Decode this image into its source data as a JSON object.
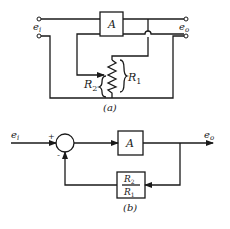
{
  "diagram_a": {
    "caption": "(a)",
    "input_label": "e",
    "input_sub": "i",
    "output_label": "e",
    "output_sub": "o",
    "amplifier_label": "A",
    "r1_label": "R",
    "r1_sub": "1",
    "r2_label": "R",
    "r2_sub": "2"
  },
  "diagram_b": {
    "caption": "(b)",
    "input_label": "e",
    "input_sub": "i",
    "output_label": "e",
    "output_sub": "o",
    "plus_sign": "+",
    "minus_sign": "-",
    "forward_block_label": "A",
    "feedback_num": "R",
    "feedback_num_sub": "2",
    "feedback_den": "R",
    "feedback_den_sub": "1"
  }
}
